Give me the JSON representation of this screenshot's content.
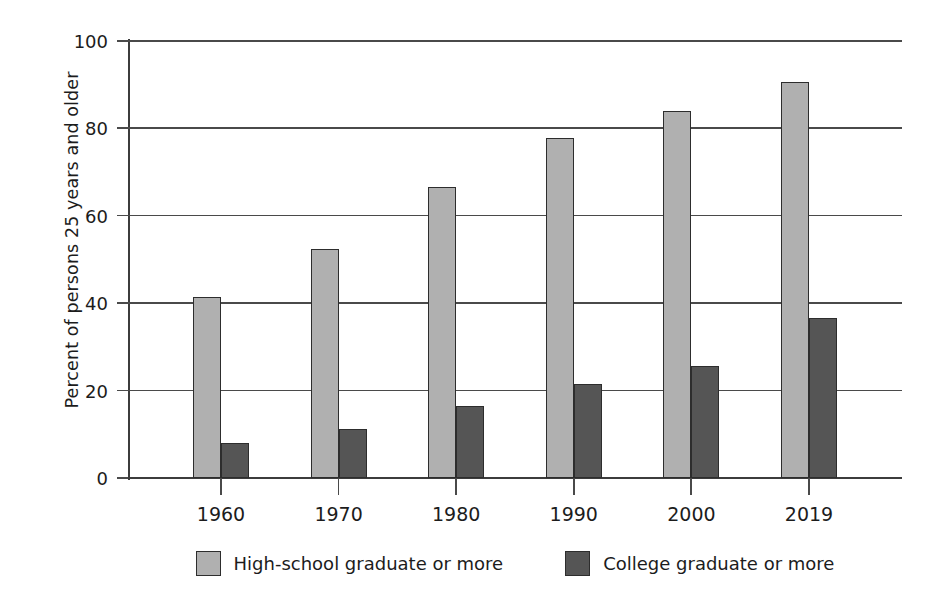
{
  "chart_data": {
    "type": "bar",
    "title": "",
    "xlabel": "",
    "ylabel": "Percent of persons 25 years and older",
    "categories": [
      "1960",
      "1970",
      "1980",
      "1990",
      "2000",
      "2019"
    ],
    "series": [
      {
        "name": "High-school graduate or more",
        "color": "#b0b0b0",
        "values": [
          41.5,
          52.5,
          66.5,
          77.8,
          84.0,
          90.6
        ]
      },
      {
        "name": "College graduate or more",
        "color": "#555555",
        "values": [
          8.0,
          11.3,
          16.5,
          21.5,
          25.7,
          36.7
        ]
      }
    ],
    "ylim": [
      0,
      100
    ],
    "yticks": [
      0,
      20,
      40,
      60,
      80,
      100
    ],
    "ytick_labels": [
      "0",
      "20",
      "40",
      "60",
      "80",
      "100"
    ],
    "grid": "horizontal",
    "legend_position": "bottom"
  },
  "axes": {
    "y_title": "Percent of persons 25 years and older"
  }
}
